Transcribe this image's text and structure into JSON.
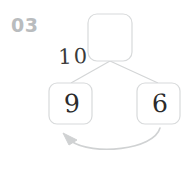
{
  "worksheet": {
    "problem_number": "03",
    "type": "number-bond-subtraction",
    "background_color": "#ffffff"
  },
  "colors": {
    "problem_number": "#b9bcbe",
    "box_stroke": "#d8dadb",
    "connector_stroke": "#d3d5d6",
    "arrow_stroke": "#d0d2d3",
    "handwriting": "#2b2b2b"
  },
  "diagram": {
    "top_box": {
      "label": "top-answer-box",
      "value": "",
      "empty": true
    },
    "side_label": {
      "name": "total-label",
      "value": "10"
    },
    "left_box": {
      "label": "left-number-box",
      "value": "9"
    },
    "right_box": {
      "label": "right-number-box",
      "value": "6"
    },
    "arrow": {
      "name": "curved-arrow",
      "direction": "right-to-left",
      "from": "right-number-box",
      "to": "left-number-box"
    }
  }
}
